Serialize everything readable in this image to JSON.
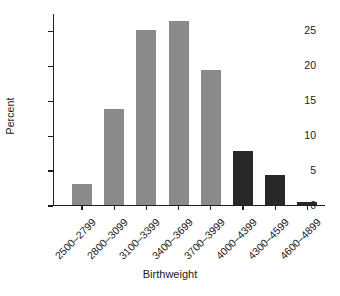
{
  "chart_data": {
    "type": "bar",
    "title": "",
    "xlabel": "Birthweight",
    "ylabel": "Percent",
    "categories": [
      "2500–2799",
      "2800–3099",
      "3100–3399",
      "3400–3699",
      "3700–3999",
      "4000–4399",
      "4300–4599",
      "4600–4899"
    ],
    "values": [
      3.1,
      13.8,
      25.1,
      26.4,
      19.4,
      7.8,
      4.3,
      0.5
    ],
    "bar_colors": [
      "#8a8a8a",
      "#8a8a8a",
      "#8a8a8a",
      "#8a8a8a",
      "#8a8a8a",
      "#282828",
      "#282828",
      "#282828"
    ],
    "ylim": [
      0,
      27.5
    ],
    "yticks": [
      0,
      5,
      10,
      15,
      20,
      25
    ],
    "ytick_labels": [
      "0",
      "5",
      "10",
      "15",
      "20",
      "25"
    ],
    "grid": false,
    "legend": null,
    "xtick_rotation": -45,
    "axis_color": "#1f1f1f",
    "background": "#ffffff"
  }
}
